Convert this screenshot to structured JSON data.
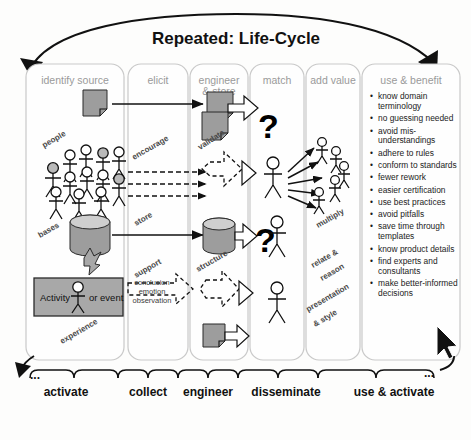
{
  "title": "Repeated: Life-Cycle",
  "columns": [
    {
      "id": "identify-source",
      "header": "identify source"
    },
    {
      "id": "elicit",
      "header": "elicit"
    },
    {
      "id": "engineer-store",
      "header": "engineer & store"
    },
    {
      "id": "match",
      "header": "match"
    },
    {
      "id": "add-value",
      "header": "add value"
    },
    {
      "id": "use-benefit",
      "header": "use & benefit"
    }
  ],
  "labels": {
    "people": "people",
    "bases": "bases",
    "experience": "experience",
    "encourage": "encourage",
    "store": "store",
    "support": "support",
    "validate": "validate",
    "structure": "structure",
    "multiply": "multiply",
    "relate_reason": "relate & reason",
    "presentation_style": "presentation & style",
    "activity": "Activity",
    "or_event": "or event",
    "question_mark": "?"
  },
  "dashed_arrow_text": [
    "conclusion",
    "emotion",
    "observation"
  ],
  "benefits": [
    "know domain terminology",
    "no guessing needed",
    "avoid mis-understandings",
    "adhere to rules",
    "conform to standards",
    "fewer rework",
    "easier certification",
    "use best practices",
    "avoid pitfalls",
    "save time through templates",
    "know product details",
    "find experts and consultants",
    "make better-informed decisions"
  ],
  "bottom_labels": [
    "activate",
    "collect",
    "engineer",
    "disseminate",
    "use & activate"
  ],
  "ellipsis": "...",
  "colors": {
    "grey_fill": "#9d9d9d",
    "panel_border": "#c9c9c9",
    "header_text": "#9a9a9a",
    "ink": "#111111"
  }
}
